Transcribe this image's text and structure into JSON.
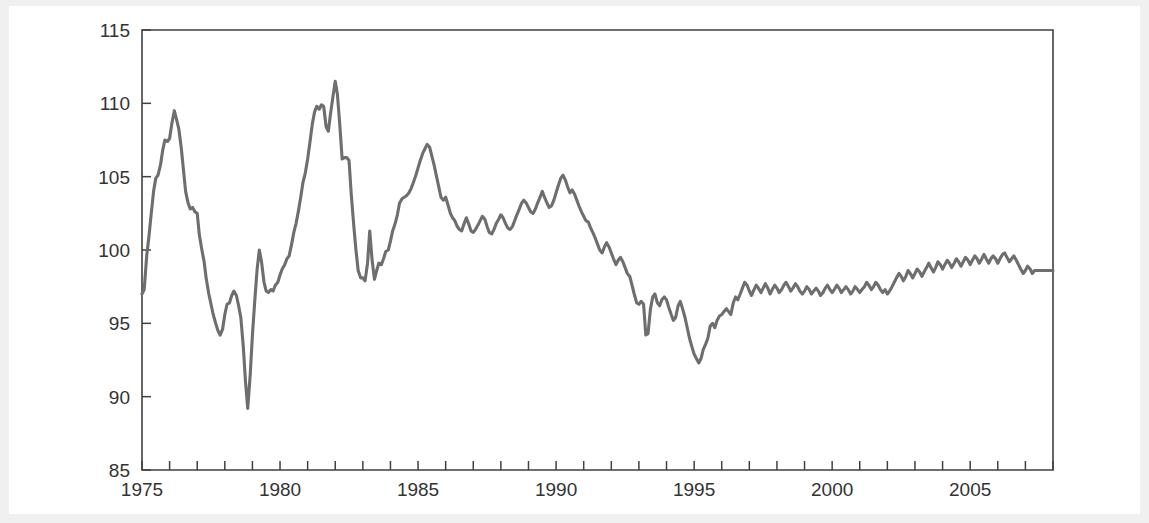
{
  "chart_data": {
    "type": "line",
    "title": "",
    "subtitle": "",
    "xlabel": "",
    "ylabel": "",
    "xlim": [
      1975.0,
      2008.0
    ],
    "ylim": [
      85,
      115
    ],
    "grid": false,
    "legend": null,
    "series_color": "#6e6e6e",
    "axis_color": "#404040",
    "background": "#ffffff",
    "y_ticks": [
      85,
      90,
      95,
      100,
      105,
      110,
      115
    ],
    "y_tick_labels": [
      "85",
      "90",
      "95",
      "100",
      "105",
      "110",
      "115"
    ],
    "x_ticks": [
      1975,
      1976,
      1977,
      1978,
      1979,
      1980,
      1981,
      1982,
      1983,
      1984,
      1985,
      1986,
      1987,
      1988,
      1989,
      1990,
      1991,
      1992,
      1993,
      1994,
      1995,
      1996,
      1997,
      1998,
      1999,
      2000,
      2001,
      2002,
      2003,
      2004,
      2005,
      2006,
      2007,
      2008
    ],
    "x_tick_labels_shown": [
      "1975",
      "1980",
      "1985",
      "1990",
      "1995",
      "2000",
      "2005"
    ],
    "x_labeled_ticks": [
      1975,
      1980,
      1985,
      1990,
      1995,
      2000,
      2005
    ],
    "minor_tick_interval": 1,
    "series": [
      {
        "name": "index",
        "x": [
          1975.0,
          1975.08,
          1975.17,
          1975.25,
          1975.33,
          1975.42,
          1975.5,
          1975.58,
          1975.67,
          1975.75,
          1975.83,
          1975.92,
          1976.0,
          1976.08,
          1976.17,
          1976.25,
          1976.33,
          1976.42,
          1976.5,
          1976.58,
          1976.67,
          1976.75,
          1976.83,
          1976.92,
          1977.0,
          1977.08,
          1977.17,
          1977.25,
          1977.33,
          1977.42,
          1977.5,
          1977.58,
          1977.67,
          1977.75,
          1977.83,
          1977.92,
          1978.0,
          1978.08,
          1978.17,
          1978.25,
          1978.33,
          1978.42,
          1978.5,
          1978.58,
          1978.67,
          1978.75,
          1978.83,
          1978.92,
          1979.0,
          1979.08,
          1979.17,
          1979.25,
          1979.33,
          1979.42,
          1979.5,
          1979.58,
          1979.67,
          1979.75,
          1979.83,
          1979.92,
          1980.0,
          1980.08,
          1980.17,
          1980.25,
          1980.33,
          1980.42,
          1980.5,
          1980.58,
          1980.67,
          1980.75,
          1980.83,
          1980.92,
          1981.0,
          1981.08,
          1981.17,
          1981.25,
          1981.33,
          1981.42,
          1981.5,
          1981.58,
          1981.67,
          1981.75,
          1981.83,
          1981.92,
          1982.0,
          1982.08,
          1982.17,
          1982.25,
          1982.33,
          1982.42,
          1982.5,
          1982.58,
          1982.67,
          1982.75,
          1982.83,
          1982.92,
          1983.0,
          1983.08,
          1983.17,
          1983.25,
          1983.33,
          1983.42,
          1983.5,
          1983.58,
          1983.67,
          1983.75,
          1983.83,
          1983.92,
          1984.0,
          1984.08,
          1984.17,
          1984.25,
          1984.33,
          1984.42,
          1984.5,
          1984.58,
          1984.67,
          1984.75,
          1984.83,
          1984.92,
          1985.0,
          1985.08,
          1985.17,
          1985.25,
          1985.33,
          1985.42,
          1985.5,
          1985.58,
          1985.67,
          1985.75,
          1985.83,
          1985.92,
          1986.0,
          1986.08,
          1986.17,
          1986.25,
          1986.33,
          1986.42,
          1986.5,
          1986.58,
          1986.67,
          1986.75,
          1986.83,
          1986.92,
          1987.0,
          1987.08,
          1987.17,
          1987.25,
          1987.33,
          1987.42,
          1987.5,
          1987.58,
          1987.67,
          1987.75,
          1987.83,
          1987.92,
          1988.0,
          1988.08,
          1988.17,
          1988.25,
          1988.33,
          1988.42,
          1988.5,
          1988.58,
          1988.67,
          1988.75,
          1988.83,
          1988.92,
          1989.0,
          1989.08,
          1989.17,
          1989.25,
          1989.33,
          1989.42,
          1989.5,
          1989.58,
          1989.67,
          1989.75,
          1989.83,
          1989.92,
          1990.0,
          1990.08,
          1990.17,
          1990.25,
          1990.33,
          1990.42,
          1990.5,
          1990.58,
          1990.67,
          1990.75,
          1990.83,
          1990.92,
          1991.0,
          1991.08,
          1991.17,
          1991.25,
          1991.33,
          1991.42,
          1991.5,
          1991.58,
          1991.67,
          1991.75,
          1991.83,
          1991.92,
          1992.0,
          1992.08,
          1992.17,
          1992.25,
          1992.33,
          1992.42,
          1992.5,
          1992.58,
          1992.67,
          1992.75,
          1992.83,
          1992.92,
          1993.0,
          1993.08,
          1993.17,
          1993.25,
          1993.33,
          1993.42,
          1993.5,
          1993.58,
          1993.67,
          1993.75,
          1993.83,
          1993.92,
          1994.0,
          1994.08,
          1994.17,
          1994.25,
          1994.33,
          1994.42,
          1994.5,
          1994.58,
          1994.67,
          1994.75,
          1994.83,
          1994.92,
          1995.0,
          1995.08,
          1995.17,
          1995.25,
          1995.33,
          1995.42,
          1995.5,
          1995.58,
          1995.67,
          1995.75,
          1995.83,
          1995.92,
          1996.0,
          1996.08,
          1996.17,
          1996.25,
          1996.33,
          1996.42,
          1996.5,
          1996.58,
          1996.67,
          1996.75,
          1996.83,
          1996.92,
          1997.0,
          1997.08,
          1997.17,
          1997.25,
          1997.33,
          1997.42,
          1997.5,
          1997.58,
          1997.67,
          1997.75,
          1997.83,
          1997.92,
          1998.0,
          1998.08,
          1998.17,
          1998.25,
          1998.33,
          1998.42,
          1998.5,
          1998.58,
          1998.67,
          1998.75,
          1998.83,
          1998.92,
          1999.0,
          1999.08,
          1999.17,
          1999.25,
          1999.33,
          1999.42,
          1999.5,
          1999.58,
          1999.67,
          1999.75,
          1999.83,
          1999.92,
          2000.0,
          2000.08,
          2000.17,
          2000.25,
          2000.33,
          2000.42,
          2000.5,
          2000.58,
          2000.67,
          2000.75,
          2000.83,
          2000.92,
          2001.0,
          2001.08,
          2001.17,
          2001.25,
          2001.33,
          2001.42,
          2001.5,
          2001.58,
          2001.67,
          2001.75,
          2001.83,
          2001.92,
          2002.0,
          2002.08,
          2002.17,
          2002.25,
          2002.33,
          2002.42,
          2002.5,
          2002.58,
          2002.67,
          2002.75,
          2002.83,
          2002.92,
          2003.0,
          2003.08,
          2003.17,
          2003.25,
          2003.33,
          2003.42,
          2003.5,
          2003.58,
          2003.67,
          2003.75,
          2003.83,
          2003.92,
          2004.0,
          2004.08,
          2004.17,
          2004.25,
          2004.33,
          2004.42,
          2004.5,
          2004.58,
          2004.67,
          2004.75,
          2004.83,
          2004.92,
          2005.0,
          2005.08,
          2005.17,
          2005.25,
          2005.33,
          2005.42,
          2005.5,
          2005.58,
          2005.67,
          2005.75,
          2005.83,
          2005.92,
          2006.0,
          2006.08,
          2006.17,
          2006.25,
          2006.33,
          2006.42,
          2006.5,
          2006.58,
          2006.67,
          2006.75,
          2006.83,
          2006.92,
          2007.0,
          2007.08,
          2007.17,
          2007.25,
          2007.33,
          2007.42,
          2007.5,
          2007.58,
          2007.67,
          2007.75,
          2007.83,
          2007.92,
          2008.0
        ],
        "y": [
          97.0,
          97.3,
          99.6,
          100.9,
          102.4,
          104.0,
          104.9,
          105.1,
          105.8,
          106.8,
          107.5,
          107.4,
          107.6,
          108.6,
          109.5,
          108.9,
          108.3,
          107.0,
          105.5,
          104.0,
          103.2,
          102.8,
          102.9,
          102.6,
          102.5,
          101.0,
          100.0,
          99.2,
          98.0,
          97.0,
          96.3,
          95.6,
          95.0,
          94.5,
          94.2,
          94.6,
          95.6,
          96.3,
          96.4,
          96.9,
          97.2,
          96.9,
          96.2,
          95.4,
          93.4,
          91.0,
          89.2,
          91.5,
          94.2,
          96.4,
          98.7,
          100.0,
          99.2,
          97.8,
          97.2,
          97.1,
          97.3,
          97.2,
          97.6,
          97.8,
          98.3,
          98.7,
          99.0,
          99.4,
          99.6,
          100.4,
          101.2,
          101.8,
          102.7,
          103.6,
          104.6,
          105.3,
          106.2,
          107.3,
          108.6,
          109.4,
          109.8,
          109.6,
          109.9,
          109.8,
          108.4,
          108.1,
          109.3,
          110.5,
          111.5,
          110.6,
          108.4,
          106.2,
          106.3,
          106.3,
          106.1,
          103.8,
          101.7,
          100.0,
          98.6,
          98.1,
          98.1,
          97.9,
          99.1,
          101.3,
          99.4,
          98.0,
          98.6,
          99.1,
          99.0,
          99.4,
          99.9,
          100.0,
          100.6,
          101.3,
          101.8,
          102.4,
          103.2,
          103.5,
          103.6,
          103.7,
          103.9,
          104.2,
          104.6,
          105.1,
          105.6,
          106.1,
          106.6,
          106.9,
          107.2,
          107.0,
          106.4,
          105.8,
          105.0,
          104.3,
          103.6,
          103.4,
          103.6,
          103.1,
          102.5,
          102.2,
          102.0,
          101.6,
          101.4,
          101.3,
          101.8,
          102.2,
          101.8,
          101.3,
          101.2,
          101.4,
          101.7,
          102.0,
          102.3,
          102.1,
          101.6,
          101.2,
          101.1,
          101.4,
          101.8,
          102.1,
          102.4,
          102.2,
          101.8,
          101.5,
          101.4,
          101.6,
          102.0,
          102.4,
          102.8,
          103.2,
          103.4,
          103.2,
          102.9,
          102.6,
          102.5,
          102.8,
          103.2,
          103.6,
          104.0,
          103.6,
          103.2,
          102.9,
          103.0,
          103.4,
          103.9,
          104.4,
          104.9,
          105.1,
          104.8,
          104.3,
          103.9,
          104.1,
          103.8,
          103.4,
          103.0,
          102.6,
          102.3,
          102.0,
          101.9,
          101.5,
          101.2,
          100.8,
          100.4,
          100.0,
          99.8,
          100.2,
          100.5,
          100.2,
          99.8,
          99.4,
          99.0,
          99.3,
          99.5,
          99.2,
          98.8,
          98.4,
          98.2,
          97.6,
          97.0,
          96.4,
          96.3,
          96.5,
          96.3,
          94.2,
          94.3,
          96.0,
          96.8,
          97.0,
          96.4,
          96.2,
          96.6,
          96.8,
          96.6,
          96.1,
          95.6,
          95.2,
          95.4,
          96.2,
          96.5,
          96.0,
          95.4,
          94.7,
          94.0,
          93.4,
          92.9,
          92.6,
          92.3,
          92.6,
          93.2,
          93.6,
          94.0,
          94.8,
          95.0,
          94.7,
          95.2,
          95.5,
          95.6,
          95.8,
          96.0,
          95.8,
          95.6,
          96.4,
          96.8,
          96.6,
          97.0,
          97.4,
          97.8,
          97.6,
          97.2,
          96.9,
          97.3,
          97.6,
          97.4,
          97.1,
          97.4,
          97.7,
          97.4,
          97.0,
          97.3,
          97.6,
          97.4,
          97.1,
          97.3,
          97.6,
          97.8,
          97.5,
          97.2,
          97.4,
          97.7,
          97.5,
          97.2,
          97.0,
          97.2,
          97.5,
          97.3,
          97.0,
          97.2,
          97.4,
          97.2,
          96.9,
          97.1,
          97.4,
          97.6,
          97.3,
          97.1,
          97.3,
          97.6,
          97.4,
          97.1,
          97.3,
          97.5,
          97.3,
          97.0,
          97.2,
          97.5,
          97.3,
          97.1,
          97.3,
          97.5,
          97.8,
          97.6,
          97.3,
          97.5,
          97.8,
          97.6,
          97.3,
          97.1,
          97.3,
          97.0,
          97.2,
          97.5,
          97.8,
          98.1,
          98.4,
          98.2,
          97.9,
          98.2,
          98.6,
          98.4,
          98.1,
          98.4,
          98.7,
          98.5,
          98.2,
          98.5,
          98.8,
          99.1,
          98.8,
          98.5,
          98.8,
          99.2,
          99.0,
          98.7,
          99.0,
          99.3,
          99.1,
          98.8,
          99.1,
          99.4,
          99.2,
          98.9,
          99.2,
          99.5,
          99.3,
          99.0,
          99.3,
          99.6,
          99.4,
          99.1,
          99.4,
          99.7,
          99.4,
          99.1,
          99.4,
          99.6,
          99.4,
          99.1,
          99.4,
          99.7,
          99.8,
          99.5,
          99.2,
          99.4,
          99.6,
          99.3,
          99.0,
          98.7,
          98.4,
          98.6,
          98.9,
          98.7,
          98.4,
          98.6,
          98.6,
          98.6,
          98.6,
          98.6,
          98.6,
          98.6,
          98.6,
          98.6
        ]
      }
    ],
    "annotations": [],
    "notable_points": {
      "start_value": 97.0,
      "peak_1976": 109.5,
      "trough_1978": 89.2,
      "peak_1982": 111.5,
      "peak_1986": 107.2,
      "peak_1990": 105.1,
      "trough_1995": 92.3,
      "end_value": 98.6
    }
  },
  "plot_geometry": {
    "left": 142,
    "right": 1053,
    "top": 30,
    "bottom": 470
  }
}
